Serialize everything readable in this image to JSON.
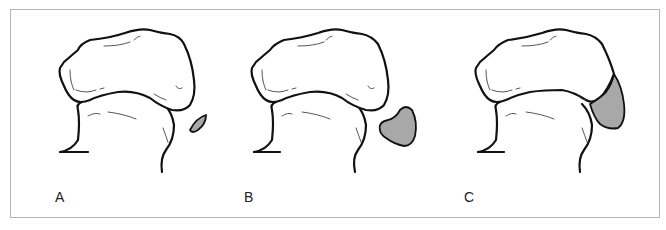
{
  "figure": {
    "panels": [
      {
        "label": "A",
        "lesion_stage": "small",
        "lesion_fill": "#a8a8a8"
      },
      {
        "label": "B",
        "lesion_stage": "medium",
        "lesion_fill": "#a8a8a8"
      },
      {
        "label": "C",
        "lesion_stage": "large",
        "lesion_fill": "#a8a8a8"
      }
    ],
    "border_color": "#b5b5b5",
    "line_color": "#111111"
  }
}
